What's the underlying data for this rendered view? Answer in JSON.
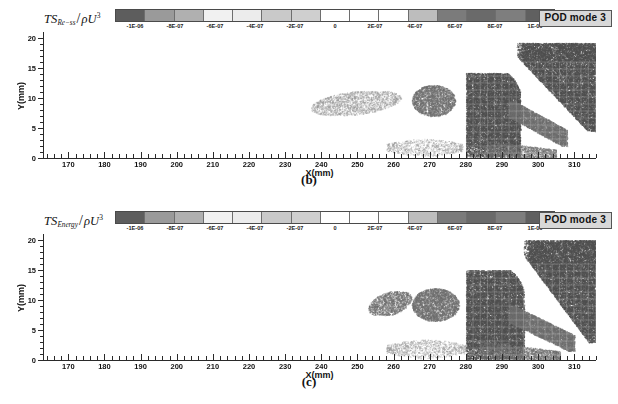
{
  "figure": {
    "type": "scientific-figure",
    "panels": [
      {
        "caption": "(b)",
        "quantity_prefix": "TS",
        "quantity_subscript": "Re−ss",
        "quantity_denominator": "ρU",
        "quantity_exponent": "3",
        "badge": "POD mode 3",
        "colorbar": {
          "ticks": [
            "-1E-06",
            "-8E-07",
            "-6E-07",
            "-4E-07",
            "-2E-07",
            "0",
            "2E-07",
            "4E-07",
            "6E-07",
            "8E-07",
            "1E-06"
          ],
          "segment_colors": [
            "#5d5d5d",
            "#9a9a9a",
            "#b0b0b0",
            "#f1f1f1",
            "#ececec",
            "#c9c9c9",
            "#cfcfcf",
            "#ffffff",
            "#ffffff",
            "#ffffff",
            "#bdbdbd",
            "#7b7b7b",
            "#6a6a6a",
            "#7e7e7e",
            "#606060"
          ],
          "min": -1e-06,
          "max": 1e-06
        },
        "axes": {
          "xlabel": "X(mm)",
          "ylabel": "Y(mm)",
          "xticks": [
            170,
            180,
            190,
            200,
            210,
            220,
            230,
            240,
            250,
            260,
            270,
            280,
            290,
            300,
            310
          ],
          "yticks": [
            0,
            5,
            10,
            15,
            20
          ],
          "xlim": [
            163,
            316
          ],
          "ylim": [
            0,
            21
          ]
        }
      },
      {
        "caption": "(c)",
        "quantity_prefix": "TS",
        "quantity_subscript": "Energy",
        "quantity_denominator": "ρU",
        "quantity_exponent": "3",
        "badge": "POD mode 3",
        "colorbar": {
          "ticks": [
            "-1E-06",
            "-8E-07",
            "-6E-07",
            "-4E-07",
            "-2E-07",
            "0",
            "2E-07",
            "4E-07",
            "6E-07",
            "8E-07",
            "1E-06"
          ],
          "segment_colors": [
            "#5d5d5d",
            "#9a9a9a",
            "#b0b0b0",
            "#f1f1f1",
            "#ececec",
            "#c9c9c9",
            "#cfcfcf",
            "#ffffff",
            "#ffffff",
            "#ffffff",
            "#bdbdbd",
            "#7b7b7b",
            "#6a6a6a",
            "#7e7e7e",
            "#606060"
          ],
          "min": -1e-06,
          "max": 1e-06
        },
        "axes": {
          "xlabel": "X(mm)",
          "ylabel": "Y(mm)",
          "xticks": [
            170,
            180,
            190,
            200,
            210,
            220,
            230,
            240,
            250,
            260,
            270,
            280,
            290,
            300,
            310
          ],
          "yticks": [
            0,
            5,
            10,
            15,
            20
          ],
          "xlim": [
            163,
            316
          ],
          "ylim": [
            0,
            21
          ]
        }
      }
    ]
  },
  "chart_data": {
    "type": "scatter",
    "title": "",
    "xlabel": "X(mm)",
    "ylabel": "Y(mm)",
    "xlim": [
      163,
      316
    ],
    "ylim": [
      0,
      21
    ],
    "grid": false,
    "legend": "colorbar",
    "colorbar_label": "TS / ρU^3",
    "colorbar_range": [
      -1e-06,
      1e-06
    ],
    "colorbar_ticks": [
      -1e-06,
      -8e-07,
      -6e-07,
      -4e-07,
      -2e-07,
      0,
      2e-07,
      4e-07,
      6e-07,
      8e-07,
      1e-06
    ],
    "series": [
      {
        "name": "(b) TS_Re-ss / rhoU^3 POD mode 3",
        "clusters": [
          {
            "id": "faint-streak-upper",
            "x_range": [
              237,
              262
            ],
            "y_range": [
              7.2,
              11.2
            ],
            "density": 0.3,
            "tone": "light",
            "shape": "ellipse-tilt"
          },
          {
            "id": "blob-270",
            "x_range": [
              265,
              277
            ],
            "y_range": [
              7.0,
              12.2
            ],
            "density": 0.62,
            "tone": "mid",
            "shape": "ellipse"
          },
          {
            "id": "low-streak-275",
            "x_range": [
              258,
              279
            ],
            "y_range": [
              0.6,
              3.0
            ],
            "density": 0.33,
            "tone": "light",
            "shape": "streak"
          },
          {
            "id": "main-block-280",
            "x_range": [
              280,
              295
            ],
            "y_range": [
              0.2,
              14.2
            ],
            "density": 0.92,
            "tone": "dark",
            "shape": "block-rounded"
          },
          {
            "id": "upper-right-wedge",
            "x_range": [
              294,
              316
            ],
            "y_range": [
              4.5,
              19.2
            ],
            "density": 0.9,
            "tone": "dark",
            "shape": "wedge"
          },
          {
            "id": "mid-right-band",
            "x_range": [
              292,
              308
            ],
            "y_range": [
              2.0,
              9.5
            ],
            "density": 0.55,
            "tone": "mid",
            "shape": "band-diagonal"
          },
          {
            "id": "low-right-tail",
            "x_range": [
              285,
              305
            ],
            "y_range": [
              0.1,
              3.0
            ],
            "density": 0.45,
            "tone": "mid",
            "shape": "tail"
          }
        ]
      },
      {
        "name": "(c) TS_Energy / rhoU^3 POD mode 3",
        "clusters": [
          {
            "id": "faint-streak-upper",
            "x_range": [
              253,
              265
            ],
            "y_range": [
              7.5,
              11.5
            ],
            "density": 0.45,
            "tone": "mid",
            "shape": "ellipse-tilt"
          },
          {
            "id": "blob-270",
            "x_range": [
              265,
              278
            ],
            "y_range": [
              6.5,
              12.0
            ],
            "density": 0.66,
            "tone": "mid",
            "shape": "ellipse"
          },
          {
            "id": "low-streak-275",
            "x_range": [
              258,
              280
            ],
            "y_range": [
              0.6,
              3.2
            ],
            "density": 0.36,
            "tone": "light",
            "shape": "streak"
          },
          {
            "id": "main-block-280",
            "x_range": [
              280,
              296
            ],
            "y_range": [
              0.2,
              15.0
            ],
            "density": 0.93,
            "tone": "dark",
            "shape": "block-rounded"
          },
          {
            "id": "upper-right-wedge",
            "x_range": [
              296,
              316
            ],
            "y_range": [
              3.0,
              20.0
            ],
            "density": 0.91,
            "tone": "dark",
            "shape": "wedge"
          },
          {
            "id": "mid-right-band",
            "x_range": [
              292,
              310
            ],
            "y_range": [
              1.5,
              9.0
            ],
            "density": 0.58,
            "tone": "mid",
            "shape": "band-diagonal"
          },
          {
            "id": "low-right-tail",
            "x_range": [
              284,
              306
            ],
            "y_range": [
              0.1,
              3.2
            ],
            "density": 0.48,
            "tone": "mid",
            "shape": "tail"
          }
        ]
      }
    ]
  }
}
